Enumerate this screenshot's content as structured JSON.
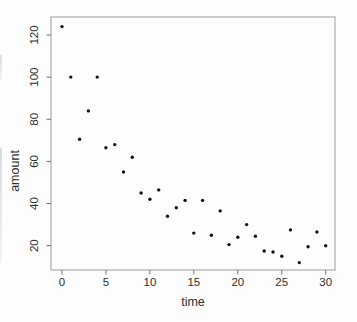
{
  "chart_data": {
    "type": "scatter",
    "title": "",
    "xlabel": "time",
    "ylabel": "amount",
    "x": [
      0,
      1,
      2,
      3,
      4,
      5,
      6,
      7,
      8,
      9,
      10,
      11,
      12,
      13,
      14,
      15,
      16,
      17,
      18,
      19,
      20,
      21,
      22,
      23,
      24,
      25,
      26,
      27,
      28,
      29,
      30
    ],
    "y": [
      124,
      100,
      70.5,
      84,
      100,
      66.5,
      68,
      55,
      62,
      45,
      42,
      46.5,
      34,
      38,
      41.5,
      26,
      41.5,
      25,
      36.5,
      20.5,
      24,
      30,
      24.5,
      17.5,
      17,
      15,
      27.5,
      12,
      19.5,
      26.5,
      20
    ],
    "x_ticks": [
      0,
      5,
      10,
      15,
      20,
      25,
      30
    ],
    "y_ticks": [
      20,
      40,
      60,
      80,
      100,
      120
    ],
    "xlim": [
      -1.2,
      31.1
    ],
    "ylim": [
      7.5,
      128.5
    ],
    "grid": false,
    "legend": "none",
    "marker": "dot",
    "point_color": "#141414",
    "frame_color": "#9b9b9b",
    "tick_color": "#6f6f6f",
    "text_color": "#2e2e2e"
  }
}
